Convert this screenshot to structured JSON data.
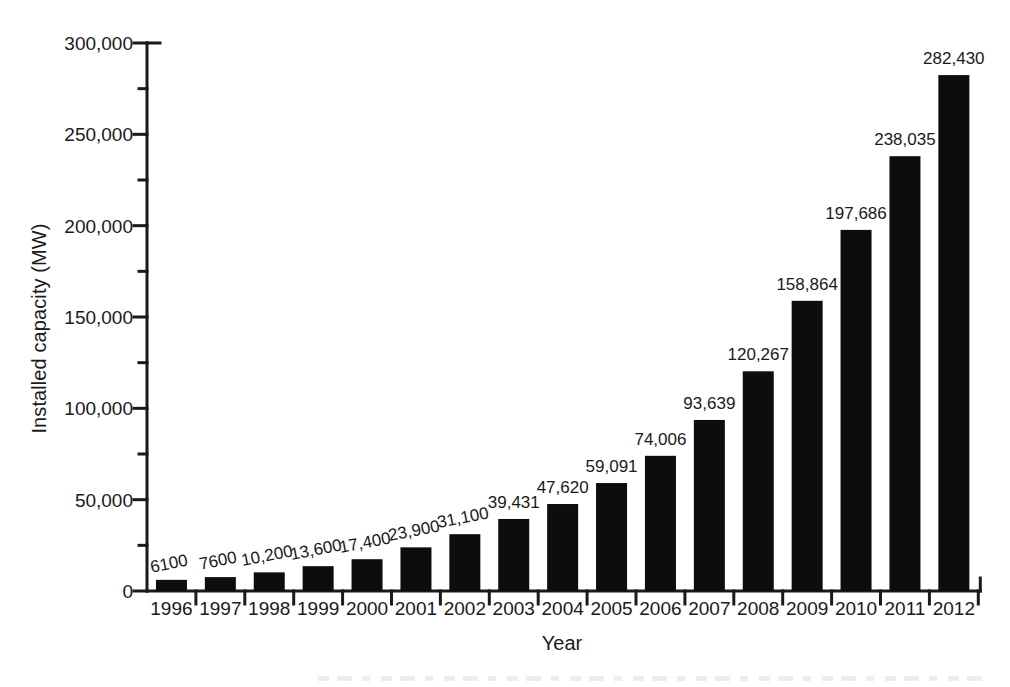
{
  "chart_data": {
    "type": "bar",
    "title": "",
    "xlabel": "Year",
    "ylabel": "Installed capacity (MW)",
    "categories": [
      "1996",
      "1997",
      "1998",
      "1999",
      "2000",
      "2001",
      "2002",
      "2003",
      "2004",
      "2005",
      "2006",
      "2007",
      "2008",
      "2009",
      "2010",
      "2011",
      "2012"
    ],
    "values": [
      6100,
      7600,
      10200,
      13600,
      17400,
      23900,
      31100,
      39431,
      47620,
      59091,
      74006,
      93639,
      120267,
      158864,
      197686,
      238035,
      282430
    ],
    "value_labels": [
      "6100",
      "7600",
      "10,200",
      "13,600",
      "17,400",
      "23,900",
      "31,100",
      "39,431",
      "47,620",
      "59,091",
      "74,006",
      "93,639",
      "120,267",
      "158,864",
      "197,686",
      "238,035",
      "282,430"
    ],
    "ylim": [
      0,
      300000
    ],
    "ytick_labels": [
      "0",
      "50,000",
      "100,000",
      "150,000",
      "200,000",
      "250,000",
      "300,000"
    ],
    "ytick_values": [
      0,
      50000,
      100000,
      150000,
      200000,
      250000,
      300000
    ],
    "minor_ytick_values": [
      25000,
      75000,
      125000,
      175000,
      225000,
      275000
    ],
    "grid": false,
    "legend": null,
    "bar_color": "#0d0d0d",
    "axis_color": "#1a1a1a",
    "background": "#ffffff"
  }
}
